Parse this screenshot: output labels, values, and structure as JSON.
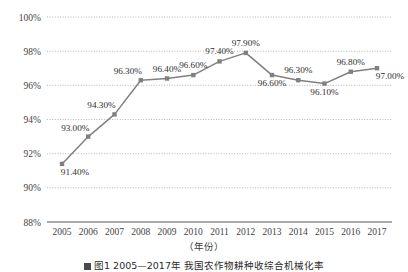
{
  "chart_data": {
    "type": "line",
    "title": "",
    "xlabel": "（年份）",
    "ylabel": "",
    "categories": [
      "2005",
      "2006",
      "2007",
      "2008",
      "2009",
      "2010",
      "2011",
      "2012",
      "2013",
      "2014",
      "2015",
      "2016",
      "2017"
    ],
    "values": [
      91.4,
      93.0,
      94.3,
      96.3,
      96.4,
      96.6,
      97.4,
      97.9,
      96.6,
      96.3,
      96.1,
      96.8,
      97.0
    ],
    "data_labels": [
      "91.40%",
      "93.00%",
      "94.30%",
      "96.30%",
      "96.40%",
      "96.60%",
      "97.40%",
      "97.90%",
      "96.60%",
      "96.30%",
      "96.10%",
      "96.80%",
      "97.00%"
    ],
    "label_positions": [
      "below-right",
      "above-left",
      "above-left",
      "above-left",
      "above",
      "above",
      "above",
      "above",
      "below",
      "above",
      "below",
      "above",
      "below-right"
    ],
    "ylim": [
      88,
      100
    ],
    "ytick_labels": [
      "88%",
      "90%",
      "92%",
      "94%",
      "96%",
      "98%",
      "100%"
    ],
    "ytick_values": [
      88,
      90,
      92,
      94,
      96,
      98,
      100
    ],
    "grid": true,
    "grid_style": "dotted",
    "legend": "none",
    "series_color": "#808080",
    "marker": "square",
    "axis_color": "#595959",
    "grid_color": "#b8b8b8"
  },
  "figure": {
    "caption": "图1  2005—2017年 我国农作物耕种收综合机械化率"
  }
}
